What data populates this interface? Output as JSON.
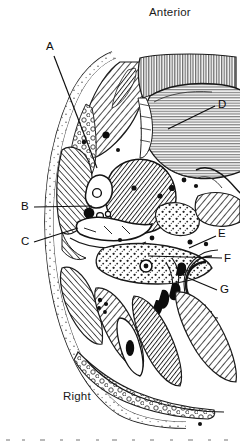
{
  "figure": {
    "type": "anatomical-cross-section-illustration",
    "style": "black-and-white engraved line drawing with hatching",
    "background_color": "#ffffff",
    "ink_color": "#1a1a1a",
    "orientation_labels": {
      "top": "Anterior",
      "bottom_left": "Right"
    },
    "leader_labels": [
      {
        "id": "A",
        "text": "A",
        "label_x": 48,
        "label_y": 46,
        "target_x": 97,
        "target_y": 168,
        "side": "left"
      },
      {
        "id": "B",
        "text": "B",
        "label_x": 25,
        "label_y": 206,
        "target_x": 92,
        "target_y": 206,
        "side": "left"
      },
      {
        "id": "C",
        "text": "C",
        "label_x": 25,
        "label_y": 241,
        "target_x": 78,
        "target_y": 228,
        "side": "left"
      },
      {
        "id": "D",
        "text": "D",
        "label_x": 221,
        "label_y": 104,
        "target_x": 168,
        "target_y": 129,
        "side": "right"
      },
      {
        "id": "E",
        "text": "E",
        "label_x": 221,
        "label_y": 233,
        "target_x": 189,
        "target_y": 248,
        "side": "right"
      },
      {
        "id": "F",
        "text": "F",
        "label_x": 227,
        "label_y": 258,
        "target_x": 148,
        "target_y": 256,
        "side": "right"
      },
      {
        "id": "G",
        "text": "G",
        "label_x": 223,
        "label_y": 289,
        "target_x": 186,
        "target_y": 277,
        "side": "right"
      }
    ],
    "regions": [
      {
        "name": "anterior-striated-organ",
        "label_ref": "D",
        "description": "large rounded finely-striated mass occupying upper right of the section"
      },
      {
        "name": "anterior-muscle-band",
        "description": "dense vertically-striated band along the upper right border"
      },
      {
        "name": "left-hatched-muscle-mass",
        "label_ref": "A",
        "description": "large diagonally hatched muscular mass in upper left of section"
      },
      {
        "name": "vessel-cluster",
        "label_ref": "B",
        "description": "small rounded dark vessel profiles in mid-left region"
      },
      {
        "name": "lateral-body-wall",
        "label_ref": "C",
        "description": "stippled body wall layer along the left margin"
      },
      {
        "name": "posterior-tissue-field",
        "label_ref": "E",
        "description": "stippled tissue field at the right posterior margin"
      },
      {
        "name": "stippled-adipose-field",
        "label_ref": "F",
        "description": "coarse stippled area in the lower middle of the section"
      },
      {
        "name": "c-shaped-bone",
        "label_ref": "G",
        "description": "C-shaped bony / cartilage profile with dark wedge markings at lower right"
      },
      {
        "name": "posterior-muscle-bundles",
        "description": "elongated hatched muscle bundles filling the lower half of the section"
      }
    ]
  }
}
